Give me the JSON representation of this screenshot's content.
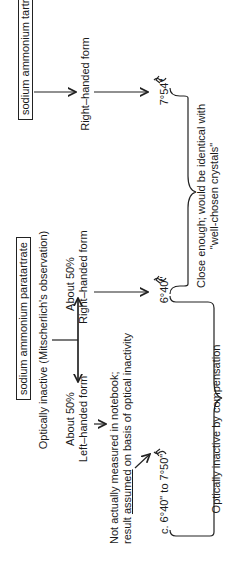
{
  "diagram": {
    "tartrate": {
      "compound": "sodium ammonium tartrate",
      "form": "Right–handed form",
      "rotation": "7°54\"",
      "rotation_direction_icon": "clockwise-arrow"
    },
    "paratartrate": {
      "compound": "sodium ammonium paratartrate",
      "observation": "Optically inactive (Mitscherlich's observation)",
      "right_branch": {
        "line1": "About 50%",
        "line2": "Right–handed form",
        "rotation": "6°40\"",
        "rotation_direction_icon": "clockwise-arrow"
      },
      "left_branch": {
        "line1": "About 50%",
        "line2": "Left–handed form"
      },
      "note": {
        "line1": "Not actually measured in notebook;",
        "line2_pre": "result ",
        "line2_underlined": "assumed",
        "line2_post": " on basis of optical inactivity"
      },
      "left_rotation": "c. 6°40\" to 7°50\"",
      "left_rotation_direction_icon": "counterclockwise-arrow"
    },
    "conclusions": {
      "close_enough": {
        "line1": "Close enough; would be identical with",
        "line2": "\"well-chosen crystals\""
      },
      "compensation": "Optically inactive by compensation"
    }
  }
}
